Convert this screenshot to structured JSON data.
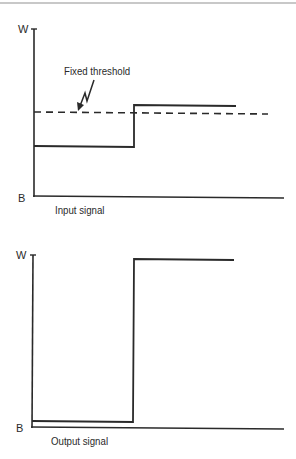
{
  "colors": {
    "ink": "#2a2a2a",
    "rule": "#c8c8c8",
    "background": "#ffffff"
  },
  "input_graph": {
    "y_top_label": "W",
    "y_bottom_label": "B",
    "caption": "Input signal",
    "threshold_label": "Fixed threshold",
    "threshold_style": "dashed",
    "signal": {
      "low_segment": "below threshold",
      "high_segment": "slightly above threshold"
    }
  },
  "output_graph": {
    "y_top_label": "W",
    "y_bottom_label": "B",
    "caption": "Output signal",
    "signal": {
      "low_segment": "B (black)",
      "high_segment": "W (white)"
    }
  }
}
